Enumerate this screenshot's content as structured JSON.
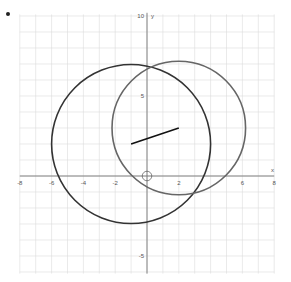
{
  "bullet": "•",
  "chart_data": {
    "type": "scatter",
    "title": "",
    "xlabel": "x",
    "ylabel": "y",
    "xlim": [
      -8,
      8
    ],
    "ylim": [
      -6,
      10
    ],
    "grid": true,
    "x_ticks": [
      "-8",
      "-6",
      "-4",
      "-2",
      "2",
      "6",
      "8"
    ],
    "y_ticks": [
      "10",
      "5",
      "-5"
    ],
    "shapes": [
      {
        "name": "dark circle",
        "kind": "circle",
        "center": [
          -1,
          2
        ],
        "radius": 5,
        "color": "#333333"
      },
      {
        "name": "light circle",
        "kind": "circle",
        "center": [
          2,
          3
        ],
        "radius": 4.2,
        "color": "#666666"
      },
      {
        "name": "segment",
        "kind": "line",
        "from": [
          -1,
          2
        ],
        "to": [
          2,
          3
        ],
        "color": "#111111"
      },
      {
        "name": "origin marker",
        "kind": "circle",
        "center": [
          0,
          0
        ],
        "radius": 0.3,
        "color": "#555555"
      }
    ]
  },
  "axis": {
    "x_label": "x",
    "y_label": "y"
  },
  "ticks_x": [
    {
      "v": -8,
      "label": "-8"
    },
    {
      "v": -6,
      "label": "-6"
    },
    {
      "v": -4,
      "label": "-4"
    },
    {
      "v": -2,
      "label": "-2"
    },
    {
      "v": 2,
      "label": "2"
    },
    {
      "v": 6,
      "label": "6"
    },
    {
      "v": 8,
      "label": "8"
    }
  ],
  "ticks_y": [
    {
      "v": 10,
      "label": "10"
    },
    {
      "v": 5,
      "label": "5"
    },
    {
      "v": -5,
      "label": "-5"
    }
  ]
}
